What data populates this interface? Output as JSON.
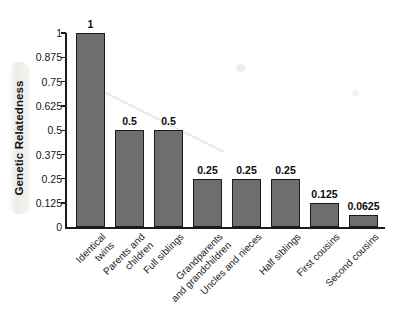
{
  "chart_data": {
    "type": "bar",
    "title": "",
    "subtitle": "",
    "xlabel": "",
    "ylabel": "Genetic Relatedness",
    "ylim": [
      0,
      1
    ],
    "grid": false,
    "legend": false,
    "orientation": "vertical",
    "bar_color": "#6e6e6e",
    "bar_edge_color": "#1b1b1b",
    "y_ticks": [
      "0",
      "0.125",
      "0.25",
      "0.375",
      "0.5",
      "0.625",
      "0.75",
      "0.875",
      "1"
    ],
    "y_tick_values": [
      0,
      0.125,
      0.25,
      0.375,
      0.5,
      0.625,
      0.75,
      0.875,
      1
    ],
    "categories": [
      "Identical twins",
      "Parents and children",
      "Full siblings",
      "Grandparents and grandchildren",
      "Uncles and nieces",
      "Half siblings",
      "First cousins",
      "Second cousins"
    ],
    "category_lines": [
      [
        "Identical",
        "twins"
      ],
      [
        "Parents and",
        "children"
      ],
      [
        "Full siblings"
      ],
      [
        "Grandparents",
        "and grandchildren"
      ],
      [
        "Uncles and nieces"
      ],
      [
        "Half siblings"
      ],
      [
        "First cousins"
      ],
      [
        "Second cousins"
      ]
    ],
    "values": [
      1,
      0.5,
      0.5,
      0.25,
      0.25,
      0.25,
      0.125,
      0.0625
    ],
    "value_labels": [
      "1",
      "0.5",
      "0.5",
      "0.25",
      "0.25",
      "0.25",
      "0.125",
      "0.0625"
    ]
  }
}
